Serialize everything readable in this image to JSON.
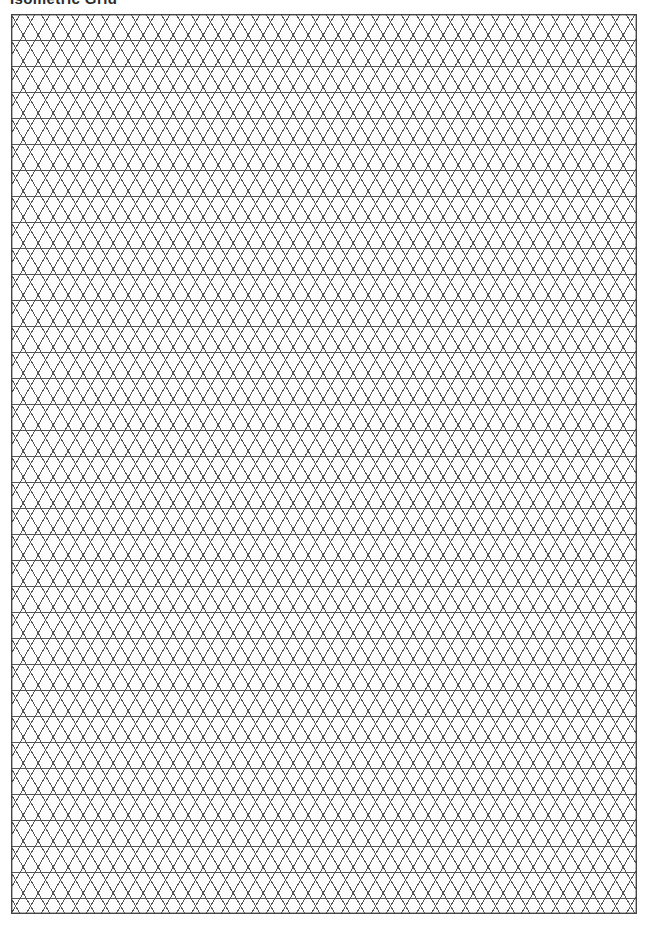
{
  "page": {
    "title": "Isometric Grid",
    "background_color": "#ffffff",
    "width": 647,
    "height": 925
  },
  "grid": {
    "name": "isometric-triangle-grid",
    "description": "Printable isometric / triangular grid paper sheet",
    "paper_color": "#fdfdfd",
    "line_color": "#555555",
    "border_color": "#444444",
    "line_width": 1,
    "border_width": 1.4,
    "origin_x": 11,
    "origin_y": 14,
    "width": 626,
    "height": 900,
    "triangle_base": 30,
    "half_base": 15,
    "row_height": 26,
    "columns": 42,
    "rows": 35,
    "angle_degrees": 60,
    "horizontal_lines": true,
    "diagonal_up_lines": true,
    "diagonal_down_lines": true,
    "border_visible": true
  }
}
